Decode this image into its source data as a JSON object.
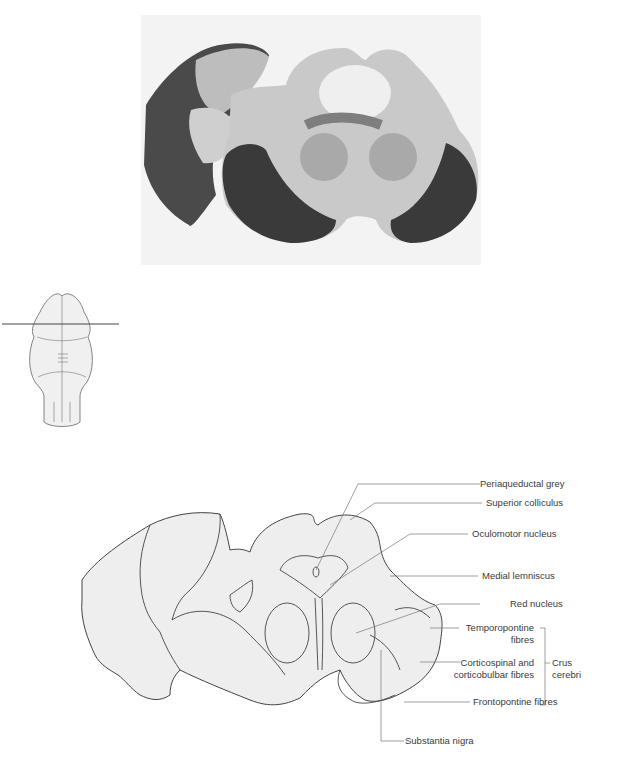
{
  "figure": {
    "photo": {
      "description": "Stained transverse section of midbrain at level of superior colliculus"
    },
    "orientation_diagram": {
      "description": "Brainstem outline with horizontal section line through upper midbrain"
    },
    "labels": [
      {
        "id": "periaqueductal",
        "text": "Periaqueductal grey"
      },
      {
        "id": "superior_colliculus",
        "text": "Superior colliculus"
      },
      {
        "id": "oculomotor",
        "text": "Oculomotor nucleus"
      },
      {
        "id": "medial_lemniscus",
        "text": "Medial lemniscus"
      },
      {
        "id": "red_nucleus",
        "text": "Red nucleus"
      },
      {
        "id": "temporopontine_1",
        "text": "Temporopontine"
      },
      {
        "id": "temporopontine_2",
        "text": "fibres"
      },
      {
        "id": "corticospinal_1",
        "text": "Corticospinal and"
      },
      {
        "id": "corticospinal_2",
        "text": "corticobulbar fibres"
      },
      {
        "id": "frontopontine",
        "text": "Frontopontine fibres"
      },
      {
        "id": "substantia_nigra",
        "text": "Substantia nigra"
      }
    ],
    "bracket_label": {
      "line1": "Crus",
      "line2": "cerebri"
    },
    "colors": {
      "line": "#444444",
      "fill": "#eeeeee",
      "leader": "#777777"
    }
  }
}
